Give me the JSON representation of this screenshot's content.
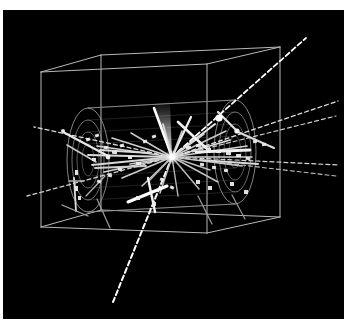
{
  "image": {
    "kind": "particle-physics-event-display",
    "title": "3D detector event display",
    "canvas_width": 344,
    "canvas_height": 330,
    "page_background_color": "#ffffff",
    "plot_background_color": "#000000",
    "plot_area": {
      "x": 3,
      "y": 10,
      "width": 341,
      "height": 309
    }
  },
  "palette": {
    "background": "#000000",
    "page": "#ffffff",
    "wireframe": "#b8b8b8",
    "detector_outline": "#9a9a9a",
    "detector_inner": "#7c7c7c",
    "track_bright": "#ffffff",
    "track_medium": "#cfcfcf",
    "track_dim": "#8e8e8e",
    "hit_marker": "#e8e8e8",
    "shower_glow": "#d8d8d8"
  },
  "detector_box": {
    "label": "outer-wireframe-box",
    "stroke": "#b8b8b8",
    "stroke_width": 1.0,
    "front_face": [
      {
        "x": 41,
        "y": 72
      },
      {
        "x": 207,
        "y": 64
      },
      {
        "x": 207,
        "y": 233
      },
      {
        "x": 41,
        "y": 227
      }
    ],
    "back_face": [
      {
        "x": 101,
        "y": 55
      },
      {
        "x": 280,
        "y": 47
      },
      {
        "x": 280,
        "y": 217
      },
      {
        "x": 101,
        "y": 210
      }
    ],
    "connector_edges": [
      [
        0,
        0
      ],
      [
        1,
        1
      ],
      [
        2,
        2
      ],
      [
        3,
        3
      ]
    ]
  },
  "detector_barrel": {
    "label": "cylindrical-tracking-volume",
    "axis_start": {
      "x": 88,
      "y": 160
    },
    "axis_end": {
      "x": 235,
      "y": 152
    },
    "left_endcap": {
      "cx": 88,
      "cy": 160,
      "rings": [
        {
          "rx": 21,
          "ry": 52,
          "stroke": "#9a9a9a"
        },
        {
          "rx": 16,
          "ry": 40,
          "stroke": "#8c8c8c"
        },
        {
          "rx": 11,
          "ry": 28,
          "stroke": "#7c7c7c"
        },
        {
          "rx": 6,
          "ry": 16,
          "stroke": "#6e6e6e"
        }
      ]
    },
    "right_endcap": {
      "cx": 235,
      "cy": 152,
      "rings": [
        {
          "rx": 21,
          "ry": 52,
          "stroke": "#9a9a9a"
        },
        {
          "rx": 16,
          "ry": 40,
          "stroke": "#8c8c8c"
        },
        {
          "rx": 11,
          "ry": 28,
          "stroke": "#7c7c7c"
        },
        {
          "rx": 6,
          "ry": 16,
          "stroke": "#6e6e6e"
        }
      ]
    },
    "barrel_rails": [
      [
        {
          "x": 88,
          "y": 108
        },
        {
          "x": 235,
          "y": 100
        }
      ],
      [
        {
          "x": 88,
          "y": 212
        },
        {
          "x": 235,
          "y": 204
        }
      ]
    ]
  },
  "interaction_vertex": {
    "label": "primary-vertex",
    "x": 172,
    "y": 157,
    "radius": 2.4,
    "color": "#ffffff"
  },
  "tracks": {
    "description": "Reconstructed charged particle trajectories radiating from the primary vertex",
    "count": 34,
    "items": [
      {
        "id": "trk-01",
        "x2": 306,
        "y2": 38,
        "style": "dashed",
        "width": 1.8,
        "color": "#ffffff",
        "dash": "5,3"
      },
      {
        "id": "trk-02",
        "x2": 338,
        "y2": 101,
        "style": "dashed",
        "width": 1.3,
        "color": "#e0e0e0",
        "dash": "4,3"
      },
      {
        "id": "trk-03",
        "x2": 336,
        "y2": 116,
        "style": "dashed",
        "width": 1.2,
        "color": "#cccccc",
        "dash": "4,3"
      },
      {
        "id": "trk-04",
        "x2": 339,
        "y2": 165,
        "style": "dashed",
        "width": 1.2,
        "color": "#d4d4d4",
        "dash": "4,3"
      },
      {
        "id": "trk-05",
        "x2": 336,
        "y2": 176,
        "style": "dashed",
        "width": 1.1,
        "color": "#bdbdbd",
        "dash": "4,3"
      },
      {
        "id": "trk-06",
        "x2": 34,
        "y2": 127,
        "style": "dashed",
        "width": 1.3,
        "color": "#d8d8d8",
        "dash": "4,3"
      },
      {
        "id": "trk-07",
        "x2": 27,
        "y2": 196,
        "style": "dashed",
        "width": 1.3,
        "color": "#d0d0d0",
        "dash": "4,3"
      },
      {
        "id": "trk-08",
        "x2": 113,
        "y2": 302,
        "style": "dashed",
        "width": 2.0,
        "color": "#ffffff",
        "dash": "5,3"
      },
      {
        "id": "trk-09",
        "x2": 154,
        "y2": 108,
        "style": "solid",
        "width": 2.6,
        "color": "#ffffff"
      },
      {
        "id": "trk-10",
        "x2": 191,
        "y2": 117,
        "style": "solid",
        "width": 2.2,
        "color": "#f0f0f0"
      },
      {
        "id": "trk-11",
        "x2": 215,
        "y2": 124,
        "style": "solid",
        "width": 2.0,
        "color": "#e6e6e6"
      },
      {
        "id": "trk-12",
        "x2": 230,
        "y2": 140,
        "style": "solid",
        "width": 1.8,
        "color": "#dcdcdc"
      },
      {
        "id": "trk-13",
        "x2": 247,
        "y2": 146,
        "style": "solid",
        "width": 1.7,
        "color": "#d2d2d2"
      },
      {
        "id": "trk-14",
        "x2": 252,
        "y2": 157,
        "style": "solid",
        "width": 1.7,
        "color": "#cfcfcf"
      },
      {
        "id": "trk-15",
        "x2": 242,
        "y2": 166,
        "style": "solid",
        "width": 1.5,
        "color": "#c6c6c6"
      },
      {
        "id": "trk-16",
        "x2": 218,
        "y2": 182,
        "style": "solid",
        "width": 1.5,
        "color": "#c0c0c0"
      },
      {
        "id": "trk-17",
        "x2": 199,
        "y2": 189,
        "style": "solid",
        "width": 1.5,
        "color": "#bcbcbc"
      },
      {
        "id": "trk-18",
        "x2": 178,
        "y2": 196,
        "style": "solid",
        "width": 1.4,
        "color": "#b6b6b6"
      },
      {
        "id": "trk-19",
        "x2": 160,
        "y2": 193,
        "style": "solid",
        "width": 1.5,
        "color": "#c4c4c4"
      },
      {
        "id": "trk-20",
        "x2": 142,
        "y2": 186,
        "style": "solid",
        "width": 1.5,
        "color": "#c8c8c8"
      },
      {
        "id": "trk-21",
        "x2": 122,
        "y2": 178,
        "style": "solid",
        "width": 1.6,
        "color": "#cdcdcd"
      },
      {
        "id": "trk-22",
        "x2": 104,
        "y2": 172,
        "style": "solid",
        "width": 1.7,
        "color": "#d3d3d3"
      },
      {
        "id": "trk-23",
        "x2": 92,
        "y2": 165,
        "style": "solid",
        "width": 1.8,
        "color": "#d8d8d8"
      },
      {
        "id": "trk-24",
        "x2": 88,
        "y2": 155,
        "style": "solid",
        "width": 1.8,
        "color": "#dadada"
      },
      {
        "id": "trk-25",
        "x2": 97,
        "y2": 146,
        "style": "solid",
        "width": 1.7,
        "color": "#d4d4d4"
      },
      {
        "id": "trk-26",
        "x2": 112,
        "y2": 138,
        "style": "solid",
        "width": 1.6,
        "color": "#cecece"
      },
      {
        "id": "trk-27",
        "x2": 131,
        "y2": 133,
        "style": "solid",
        "width": 1.5,
        "color": "#c8c8c8"
      },
      {
        "id": "trk-28",
        "x2": 204,
        "y2": 134,
        "style": "solid",
        "width": 1.6,
        "color": "#d6d6d6"
      },
      {
        "id": "trk-29",
        "x2": 226,
        "y2": 131,
        "style": "solid",
        "width": 1.5,
        "color": "#cbcbcb"
      },
      {
        "id": "trk-30",
        "x2": 210,
        "y2": 170,
        "style": "solid",
        "width": 1.4,
        "color": "#bebebe"
      },
      {
        "id": "trk-31",
        "x2": 150,
        "y2": 180,
        "style": "solid",
        "width": 1.4,
        "color": "#b8b8b8"
      },
      {
        "id": "trk-32",
        "x2": 130,
        "y2": 164,
        "style": "solid",
        "width": 1.6,
        "color": "#c9c9c9"
      },
      {
        "id": "trk-33",
        "x2": 163,
        "y2": 124,
        "style": "solid",
        "width": 1.7,
        "color": "#dddddd"
      },
      {
        "id": "trk-34",
        "x2": 182,
        "y2": 131,
        "style": "solid",
        "width": 1.6,
        "color": "#d0d0d0"
      }
    ]
  },
  "secondary_segments": {
    "description": "Short stubs, kinks and secondary tracks not originating at the vertex",
    "items": [
      {
        "id": "seg-01",
        "x1": 63,
        "y1": 132,
        "x2": 108,
        "y2": 156,
        "width": 2.2,
        "color": "#e8e8e8"
      },
      {
        "id": "seg-02",
        "x1": 67,
        "y1": 145,
        "x2": 96,
        "y2": 162,
        "width": 1.6,
        "color": "#c8c8c8"
      },
      {
        "id": "seg-03",
        "x1": 74,
        "y1": 178,
        "x2": 76,
        "y2": 211,
        "width": 1.8,
        "color": "#dcdcdc"
      },
      {
        "id": "seg-04",
        "x1": 69,
        "y1": 181,
        "x2": 84,
        "y2": 181,
        "width": 1.3,
        "color": "#b4b4b4"
      },
      {
        "id": "seg-05",
        "x1": 62,
        "y1": 205,
        "x2": 88,
        "y2": 216,
        "width": 1.3,
        "color": "#a8a8a8"
      },
      {
        "id": "seg-06",
        "x1": 97,
        "y1": 199,
        "x2": 110,
        "y2": 228,
        "width": 1.2,
        "color": "#9e9e9e"
      },
      {
        "id": "seg-07",
        "x1": 128,
        "y1": 202,
        "x2": 167,
        "y2": 186,
        "width": 3.0,
        "color": "#ffffff"
      },
      {
        "id": "seg-08",
        "x1": 148,
        "y1": 178,
        "x2": 155,
        "y2": 212,
        "width": 2.4,
        "color": "#f4f4f4"
      },
      {
        "id": "seg-09",
        "x1": 178,
        "y1": 122,
        "x2": 206,
        "y2": 148,
        "width": 2.6,
        "color": "#efefef"
      },
      {
        "id": "seg-10",
        "x1": 218,
        "y1": 112,
        "x2": 236,
        "y2": 130,
        "width": 2.2,
        "color": "#e4e4e4"
      },
      {
        "id": "seg-11",
        "x1": 238,
        "y1": 132,
        "x2": 274,
        "y2": 148,
        "width": 2.0,
        "color": "#dadada"
      },
      {
        "id": "seg-12",
        "x1": 198,
        "y1": 196,
        "x2": 212,
        "y2": 224,
        "width": 1.2,
        "color": "#9a9a9a"
      },
      {
        "id": "seg-13",
        "x1": 232,
        "y1": 195,
        "x2": 245,
        "y2": 219,
        "width": 1.2,
        "color": "#9a9a9a"
      },
      {
        "id": "seg-14",
        "x1": 86,
        "y1": 196,
        "x2": 105,
        "y2": 176,
        "width": 1.3,
        "color": "#aeaeae"
      },
      {
        "id": "seg-15",
        "x1": 196,
        "y1": 152,
        "x2": 250,
        "y2": 150,
        "width": 2.8,
        "color": "#f0f0f0"
      },
      {
        "id": "seg-16",
        "x1": 200,
        "y1": 160,
        "x2": 258,
        "y2": 164,
        "width": 2.0,
        "color": "#d8d8d8"
      },
      {
        "id": "seg-17",
        "x1": 100,
        "y1": 150,
        "x2": 150,
        "y2": 153,
        "width": 2.0,
        "color": "#dadada"
      },
      {
        "id": "seg-18",
        "x1": 95,
        "y1": 168,
        "x2": 146,
        "y2": 166,
        "width": 1.8,
        "color": "#cecece"
      }
    ]
  },
  "shower_cone": {
    "label": "calorimeter-shower-wedge",
    "apex": {
      "x": 172,
      "y": 157
    },
    "left": {
      "x": 154,
      "y": 104
    },
    "right": {
      "x": 170,
      "y": 102
    },
    "color": "#c8c8c8"
  },
  "hit_markers": {
    "description": "Detector hit rectangles along reconstructed tracks",
    "color": "#ececec",
    "items": [
      {
        "x": 86,
        "y": 138,
        "w": 4,
        "h": 3,
        "rot": -20
      },
      {
        "x": 95,
        "y": 134,
        "w": 4,
        "h": 3,
        "rot": -20
      },
      {
        "x": 104,
        "y": 146,
        "w": 4,
        "h": 3,
        "rot": 8
      },
      {
        "x": 112,
        "y": 151,
        "w": 5,
        "h": 3,
        "rot": 4
      },
      {
        "x": 120,
        "y": 144,
        "w": 4,
        "h": 3,
        "rot": -12
      },
      {
        "x": 128,
        "y": 156,
        "w": 4,
        "h": 3,
        "rot": 2
      },
      {
        "x": 136,
        "y": 162,
        "w": 5,
        "h": 3,
        "rot": 6
      },
      {
        "x": 118,
        "y": 168,
        "w": 4,
        "h": 3,
        "rot": 14
      },
      {
        "x": 108,
        "y": 174,
        "w": 4,
        "h": 3,
        "rot": 16
      },
      {
        "x": 97,
        "y": 180,
        "w": 4,
        "h": 3,
        "rot": 18
      },
      {
        "x": 75,
        "y": 170,
        "w": 3,
        "h": 5,
        "rot": 0
      },
      {
        "x": 75,
        "y": 186,
        "w": 3,
        "h": 5,
        "rot": 0
      },
      {
        "x": 78,
        "y": 196,
        "w": 3,
        "h": 4,
        "rot": 0
      },
      {
        "x": 186,
        "y": 146,
        "w": 5,
        "h": 3,
        "rot": -4
      },
      {
        "x": 196,
        "y": 144,
        "w": 5,
        "h": 3,
        "rot": -4
      },
      {
        "x": 206,
        "y": 148,
        "w": 5,
        "h": 3,
        "rot": 0
      },
      {
        "x": 216,
        "y": 150,
        "w": 5,
        "h": 3,
        "rot": 0
      },
      {
        "x": 226,
        "y": 152,
        "w": 5,
        "h": 3,
        "rot": 2
      },
      {
        "x": 236,
        "y": 154,
        "w": 5,
        "h": 3,
        "rot": 2
      },
      {
        "x": 246,
        "y": 157,
        "w": 4,
        "h": 3,
        "rot": 4
      },
      {
        "x": 200,
        "y": 163,
        "w": 4,
        "h": 3,
        "rot": 6
      },
      {
        "x": 212,
        "y": 166,
        "w": 4,
        "h": 3,
        "rot": 6
      },
      {
        "x": 224,
        "y": 169,
        "w": 4,
        "h": 3,
        "rot": 6
      },
      {
        "x": 160,
        "y": 178,
        "w": 4,
        "h": 3,
        "rot": 20
      },
      {
        "x": 170,
        "y": 186,
        "w": 4,
        "h": 3,
        "rot": 24
      },
      {
        "x": 196,
        "y": 180,
        "w": 4,
        "h": 4,
        "rot": 0
      },
      {
        "x": 208,
        "y": 186,
        "w": 4,
        "h": 4,
        "rot": 0
      },
      {
        "x": 230,
        "y": 182,
        "w": 4,
        "h": 4,
        "rot": 0
      },
      {
        "x": 244,
        "y": 190,
        "w": 4,
        "h": 4,
        "rot": 0
      },
      {
        "x": 136,
        "y": 196,
        "w": 4,
        "h": 4,
        "rot": 0
      },
      {
        "x": 152,
        "y": 202,
        "w": 4,
        "h": 4,
        "rot": 0
      },
      {
        "x": 253,
        "y": 140,
        "w": 4,
        "h": 3,
        "rot": -8
      },
      {
        "x": 262,
        "y": 143,
        "w": 4,
        "h": 3,
        "rot": -8
      },
      {
        "x": 92,
        "y": 158,
        "w": 4,
        "h": 3,
        "rot": 0
      },
      {
        "x": 143,
        "y": 140,
        "w": 4,
        "h": 3,
        "rot": -14
      },
      {
        "x": 152,
        "y": 135,
        "w": 4,
        "h": 3,
        "rot": -18
      }
    ]
  },
  "bright_nodes": {
    "description": "High energy deposit blobs",
    "items": [
      {
        "x": 219,
        "y": 118,
        "r": 3.6,
        "color": "#ffffff"
      },
      {
        "x": 237,
        "y": 131,
        "r": 2.6,
        "color": "#f4f4f4"
      },
      {
        "x": 108,
        "y": 157,
        "r": 2.4,
        "color": "#f0f0f0"
      },
      {
        "x": 172,
        "y": 157,
        "r": 3.0,
        "color": "#ffffff"
      },
      {
        "x": 63,
        "y": 131,
        "r": 2.0,
        "color": "#e4e4e4"
      }
    ]
  }
}
